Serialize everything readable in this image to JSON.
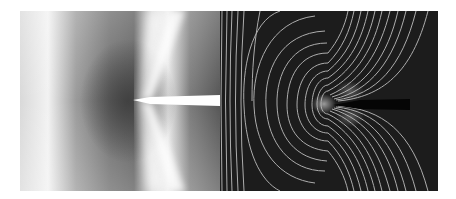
{
  "figure": {
    "panels": [
      {
        "name": "intensity-field",
        "style": "grayscale",
        "background": "#8a8a8a",
        "body_color": "#ffffff"
      },
      {
        "name": "contour-field",
        "style": "contour-lines",
        "background": "#1a1a1a",
        "line_color": "#bdbdbd",
        "wake_color": "#050505"
      }
    ]
  }
}
